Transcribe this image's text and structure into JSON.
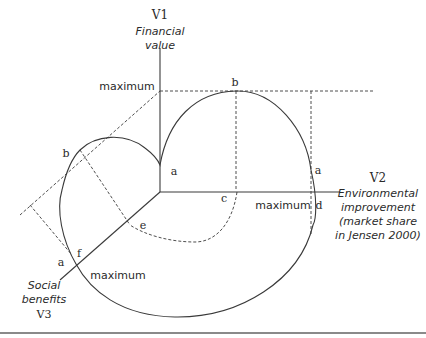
{
  "diagram": {
    "axes": {
      "v1": {
        "id": "V1",
        "label_lines": [
          "Financial",
          "value"
        ]
      },
      "v2": {
        "id": "V2",
        "label_lines": [
          "Environmental",
          "improvement",
          "(market share",
          "in Jensen 2000)"
        ]
      },
      "v3": {
        "id": "V3",
        "label_lines": [
          "Social",
          "benefits"
        ]
      }
    },
    "maximum_labels": {
      "v1": "maximum",
      "v2": "maximum",
      "v3": "maximum"
    },
    "point_labels": {
      "b_top": "b",
      "a_v1": "a",
      "a_right": "a",
      "c": "c",
      "d": "d",
      "b_left": "b",
      "e": "e",
      "f": "f",
      "a_left": "a"
    },
    "colors": {
      "line": "#3a3a3a",
      "text": "#2a2a2a",
      "rule": "#8a8a8a"
    }
  }
}
